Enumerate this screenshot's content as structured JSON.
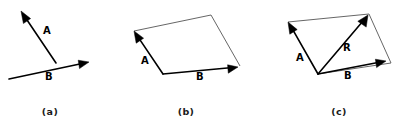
{
  "figure": {
    "background_color": "#ffffff",
    "stroke_color": "#000000",
    "thin_edge_color": "#555555",
    "panels": [
      {
        "caption": "(a)",
        "caption_pos": {
          "x": 50,
          "y": 115
        },
        "vectors": [
          {
            "name": "A",
            "label": "A",
            "label_pos": {
              "x": 43,
              "y": 34
            },
            "tail": {
              "x": 56,
              "y": 63
            },
            "tip": {
              "x": 21,
              "y": 11
            }
          },
          {
            "name": "B",
            "label": "B",
            "label_pos": {
              "x": 45,
              "y": 80
            },
            "tail": {
              "x": 9,
              "y": 79
            },
            "tip": {
              "x": 89,
              "y": 62
            }
          }
        ],
        "edges": []
      },
      {
        "caption": "(b)",
        "caption_pos": {
          "x": 180,
          "y": 115
        },
        "vectors": [
          {
            "name": "A",
            "label": "A",
            "label_pos": {
              "x": 141,
              "y": 64
            },
            "tail": {
              "x": 163,
              "y": 74
            },
            "tip": {
              "x": 134,
              "y": 31
            }
          },
          {
            "name": "B",
            "label": "B",
            "label_pos": {
              "x": 196,
              "y": 80
            },
            "tail": {
              "x": 163,
              "y": 74
            },
            "tip": {
              "x": 238,
              "y": 67
            }
          }
        ],
        "edges": [
          {
            "from": {
              "x": 134,
              "y": 31
            },
            "to": {
              "x": 211,
              "y": 15
            }
          },
          {
            "from": {
              "x": 211,
              "y": 15
            },
            "to": {
              "x": 240,
              "y": 66
            }
          }
        ]
      },
      {
        "caption": "(c)",
        "caption_pos": {
          "x": 333,
          "y": 115
        },
        "vectors": [
          {
            "name": "A",
            "label": "A",
            "label_pos": {
              "x": 296,
              "y": 61
            },
            "tail": {
              "x": 318,
              "y": 74
            },
            "tip": {
              "x": 288,
              "y": 22
            }
          },
          {
            "name": "B",
            "label": "B",
            "label_pos": {
              "x": 344,
              "y": 79
            },
            "tail": {
              "x": 318,
              "y": 74
            },
            "tip": {
              "x": 386,
              "y": 61
            }
          },
          {
            "name": "R",
            "label": "R",
            "label_pos": {
              "x": 343,
              "y": 51
            },
            "tail": {
              "x": 318,
              "y": 74
            },
            "tip": {
              "x": 368,
              "y": 15
            }
          }
        ],
        "edges": [
          {
            "from": {
              "x": 288,
              "y": 22
            },
            "to": {
              "x": 369,
              "y": 14
            }
          },
          {
            "from": {
              "x": 369,
              "y": 14
            },
            "to": {
              "x": 391,
              "y": 63
            }
          },
          {
            "from": {
              "x": 391,
              "y": 63
            },
            "to": {
              "x": 318,
              "y": 74
            }
          }
        ]
      }
    ]
  }
}
